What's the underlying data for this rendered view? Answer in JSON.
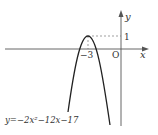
{
  "diagram": {
    "type": "function-graph",
    "equation": "y=−2x²−12x−17",
    "axis_labels": {
      "x": "x",
      "y": "y",
      "origin": "O"
    },
    "vertex": {
      "x_label": "−3",
      "y_label": "1"
    },
    "colors": {
      "axes": "#555555",
      "curve": "#222222",
      "dashed": "#777777",
      "text": "#333333"
    }
  }
}
